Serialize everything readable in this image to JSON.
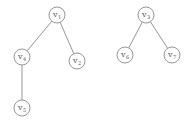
{
  "diagram": {
    "type": "graph-forest",
    "nodes": [
      {
        "id": "v1",
        "label": "v",
        "sub": "1",
        "x": 57,
        "y": 15
      },
      {
        "id": "v2",
        "label": "v",
        "sub": "2",
        "x": 77,
        "y": 61
      },
      {
        "id": "v4",
        "label": "v",
        "sub": "4",
        "x": 22,
        "y": 57
      },
      {
        "id": "v5",
        "label": "v",
        "sub": "5",
        "x": 22,
        "y": 108
      },
      {
        "id": "v3",
        "label": "v",
        "sub": "3",
        "x": 146,
        "y": 15
      },
      {
        "id": "v6",
        "label": "v",
        "sub": "6",
        "x": 125,
        "y": 55
      },
      {
        "id": "v7",
        "label": "v",
        "sub": "7",
        "x": 172,
        "y": 55
      }
    ],
    "edges": [
      [
        "v1",
        "v4"
      ],
      [
        "v1",
        "v2"
      ],
      [
        "v4",
        "v5"
      ],
      [
        "v3",
        "v6"
      ],
      [
        "v3",
        "v7"
      ]
    ]
  }
}
